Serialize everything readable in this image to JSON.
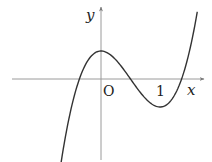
{
  "figure": {
    "axis_labels": {
      "x": "x",
      "y": "y"
    },
    "origin_label": "O",
    "tick_labels": [
      {
        "value": 1,
        "label": "1"
      }
    ],
    "colors": {
      "axis": "#9a9a9a",
      "curve": "#333333",
      "text": "#222222",
      "background": "#ffffff"
    }
  },
  "chart_data": {
    "type": "line",
    "title": "",
    "xlabel": "x",
    "ylabel": "y",
    "function": "y = 2x^3 - 3x^2 + 0.5 (shape approximation)",
    "x_range": [
      -0.68,
      1.63
    ],
    "critical_points": [
      {
        "type": "local_max",
        "x": 0,
        "y": 0.5
      },
      {
        "type": "local_min",
        "x": 1,
        "y": -0.5
      }
    ],
    "roots_approx": [
      -0.37,
      0.5,
      1.37
    ],
    "series": [
      {
        "name": "f(x)",
        "x": [
          -0.68,
          -0.5,
          -0.37,
          -0.25,
          0,
          0.25,
          0.5,
          0.75,
          1,
          1.25,
          1.37,
          1.5,
          1.63
        ],
        "y": [
          -1.52,
          -0.5,
          0.0,
          0.28,
          0.5,
          0.34,
          0.0,
          -0.34,
          -0.5,
          -0.28,
          0.0,
          0.5,
          1.17
        ]
      }
    ],
    "grid": false,
    "legend": null
  }
}
